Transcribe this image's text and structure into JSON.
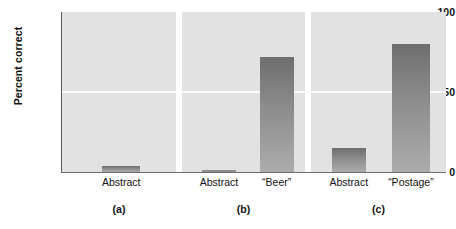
{
  "chart_data": {
    "type": "bar",
    "title": "",
    "subtitle": "",
    "xlabel": "",
    "ylabel": "Percent correct",
    "ylim": [
      0,
      100
    ],
    "yticks": [
      "0",
      "50",
      "100"
    ],
    "grid": "horizontal gridline at 50 only",
    "legend": "none",
    "panel_layout": "three side-by-side panels sharing one y-axis",
    "colors": {
      "panel_background": "#e2e2e2",
      "bar_top": "#6e6e6e",
      "bar_bottom": "#acacac",
      "gridline": "#fbfbfb",
      "axis": "#5a5a5a",
      "text": "#111111",
      "figure_background": "#ffffff"
    },
    "panels": [
      {
        "caption": "(a)",
        "categories": [
          "Abstract"
        ],
        "values": [
          4
        ]
      },
      {
        "caption": "(b)",
        "categories": [
          "Abstract",
          "“Beer”"
        ],
        "values": [
          1,
          72
        ]
      },
      {
        "caption": "(c)",
        "categories": [
          "Abstract",
          "“Postage”"
        ],
        "values": [
          15,
          80
        ]
      }
    ]
  },
  "axis": {
    "y_title": "Percent correct",
    "tick_100": "100",
    "tick_50": "50",
    "tick_0": "0"
  },
  "xticks": {
    "a_abstract": "Abstract",
    "b_abstract": "Abstract",
    "b_beer": "“Beer”",
    "c_abstract": "Abstract",
    "c_postage": "“Postage”"
  },
  "captions": {
    "a": "(a)",
    "b": "(b)",
    "c": "(c)"
  }
}
